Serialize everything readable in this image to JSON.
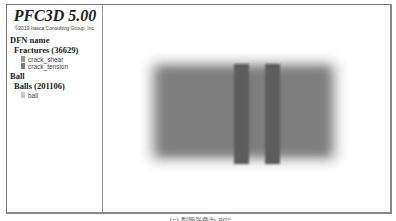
{
  "legend": {
    "title": "PFC3D 5.00",
    "copyright": "©2019 Itasca Consulting Group, Inc.",
    "groups": [
      {
        "heading": "DFN name",
        "subheading": "Fractures (36629)",
        "items": [
          {
            "label": "crack_shear",
            "color": "#9a9a9a"
          },
          {
            "label": "crack_tension",
            "color": "#7a7a7a"
          }
        ]
      },
      {
        "heading": "Ball",
        "subheading": "Balls (201106)",
        "items": [
          {
            "label": "ball",
            "color": "#c8c8c8"
          }
        ]
      }
    ]
  },
  "viewport": {
    "description": "3D model view: gray rectangular specimen with two vertical crack bands"
  },
  "caption": "(c) 裂隙张角为 90°"
}
